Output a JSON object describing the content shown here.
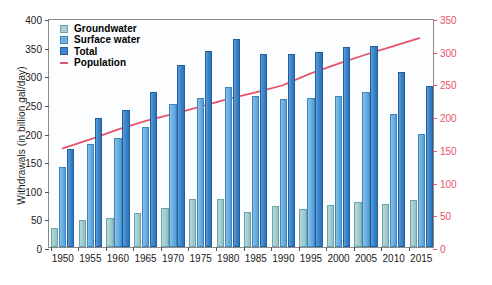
{
  "chart_data": {
    "type": "bar",
    "title": "",
    "xlabel": "",
    "ylabel": "Withdrawals (in billion gal/day)",
    "y2label": "Population (in millions)",
    "categories": [
      "1950",
      "1955",
      "1960",
      "1965",
      "1970",
      "1975",
      "1980",
      "1985",
      "1990",
      "1995",
      "2000",
      "2005",
      "2010",
      "2015"
    ],
    "ylim": [
      0,
      400
    ],
    "yticks": [
      0,
      50,
      100,
      150,
      200,
      250,
      300,
      350,
      400
    ],
    "y2lim": [
      0,
      350
    ],
    "y2ticks": [
      0,
      50,
      100,
      150,
      200,
      250,
      300,
      350
    ],
    "grid": false,
    "legend_position": "top-left",
    "series": [
      {
        "name": "Groundwater",
        "kind": "bar",
        "axis": "left",
        "color": "#a9d1d4",
        "values": [
          34,
          47,
          50,
          60,
          68,
          83,
          83,
          62,
          71,
          66,
          74,
          79,
          75,
          82
        ]
      },
      {
        "name": "Surface water",
        "kind": "bar",
        "axis": "left",
        "color": "#6fb0e2",
        "values": [
          140,
          180,
          190,
          210,
          250,
          260,
          280,
          263,
          258,
          261,
          264,
          270,
          232,
          198
        ]
      },
      {
        "name": "Total",
        "kind": "bar",
        "axis": "left",
        "color": "#3d86cb",
        "values": [
          172,
          225,
          240,
          270,
          318,
          343,
          363,
          338,
          338,
          340,
          350,
          351,
          306,
          281
        ]
      },
      {
        "name": "Population",
        "kind": "line",
        "axis": "right",
        "color": "#e8536b",
        "values": [
          152,
          166,
          181,
          194,
          205,
          216,
          228,
          238,
          249,
          267,
          282,
          296,
          309,
          322
        ]
      }
    ]
  },
  "legend": {
    "groundwater": "Groundwater",
    "surface_water": "Surface water",
    "total": "Total",
    "population": "Population"
  }
}
